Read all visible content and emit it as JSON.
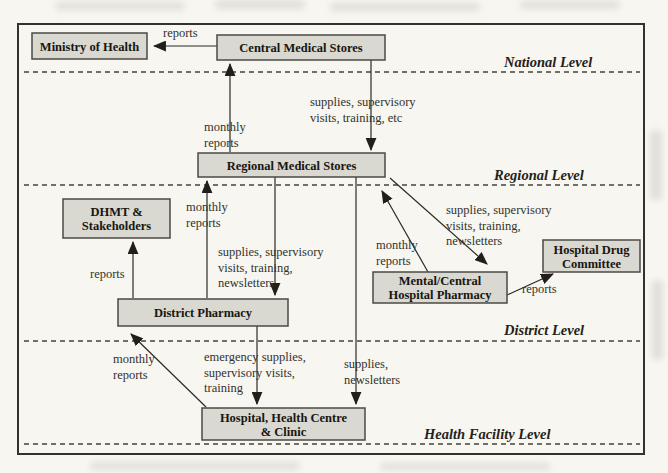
{
  "diagram": {
    "title_hint": "Drug distribution and reporting flows across health system levels",
    "colors": {
      "paper": "#f7f6f1",
      "box_fill": "#d9d8d1",
      "box_stroke": "#4c4a44",
      "line": "#2b2a24",
      "text": "#181610"
    },
    "frame": {
      "x": 18,
      "y": 24,
      "w": 626,
      "h": 430
    },
    "levels": [
      {
        "name": "national-level",
        "label": "National Level",
        "label_x": 504,
        "label_y": 67,
        "line_y": 72
      },
      {
        "name": "regional-level",
        "label": "Regional Level",
        "label_x": 494,
        "label_y": 180,
        "line_y": 185
      },
      {
        "name": "district-level",
        "label": "District Level",
        "label_x": 504,
        "label_y": 335,
        "line_y": 341
      },
      {
        "name": "health-facility-level",
        "label": "Health Facility Level",
        "label_x": 424,
        "label_y": 439,
        "line_y": 444
      }
    ],
    "nodes": [
      {
        "name": "ministry-of-health",
        "lines": [
          "Ministry of Health"
        ],
        "x": 32,
        "y": 33,
        "w": 115,
        "h": 26
      },
      {
        "name": "central-medical-stores",
        "lines": [
          "Central Medical Stores"
        ],
        "x": 217,
        "y": 35,
        "w": 168,
        "h": 25
      },
      {
        "name": "regional-medical-stores",
        "lines": [
          "Regional Medical Stores"
        ],
        "x": 198,
        "y": 153,
        "w": 187,
        "h": 24
      },
      {
        "name": "dhmt-stakeholders",
        "lines": [
          "DHMT &",
          "Stakeholders"
        ],
        "x": 63,
        "y": 199,
        "w": 107,
        "h": 39
      },
      {
        "name": "district-pharmacy",
        "lines": [
          "District Pharmacy"
        ],
        "x": 118,
        "y": 299,
        "w": 170,
        "h": 27
      },
      {
        "name": "mental-central-hospital-pharmacy",
        "lines": [
          "Mental/Central",
          "Hospital Pharmacy"
        ],
        "x": 373,
        "y": 272,
        "w": 134,
        "h": 31
      },
      {
        "name": "hospital-drug-committee",
        "lines": [
          "Hospital Drug",
          "Committee"
        ],
        "x": 543,
        "y": 240,
        "w": 97,
        "h": 32
      },
      {
        "name": "hospital-health-centre-clinic",
        "lines": [
          "Hospital, Health Centre",
          "& Clinic"
        ],
        "x": 202,
        "y": 408,
        "w": 163,
        "h": 32
      }
    ],
    "edges": [
      {
        "name": "edge-cms-to-moh",
        "x1": 217,
        "y1": 46,
        "x2": 154,
        "y2": 46
      },
      {
        "name": "edge-rms-to-cms",
        "x1": 230,
        "y1": 152,
        "x2": 230,
        "y2": 64
      },
      {
        "name": "edge-cms-to-rms",
        "x1": 371,
        "y1": 60,
        "x2": 371,
        "y2": 150
      },
      {
        "name": "edge-dp-to-rms",
        "x1": 207,
        "y1": 298,
        "x2": 207,
        "y2": 181
      },
      {
        "name": "edge-rms-to-dp",
        "x1": 275,
        "y1": 177,
        "x2": 275,
        "y2": 295
      },
      {
        "name": "edge-dp-to-dhmt",
        "x1": 133,
        "y1": 298,
        "x2": 133,
        "y2": 242
      },
      {
        "name": "edge-rms-to-hospital",
        "x1": 356,
        "y1": 177,
        "x2": 356,
        "y2": 404
      },
      {
        "name": "edge-hospital-to-dp",
        "x1": 206,
        "y1": 407,
        "x2": 131,
        "y2": 334
      },
      {
        "name": "edge-dp-to-hospital",
        "x1": 257,
        "y1": 326,
        "x2": 257,
        "y2": 404
      },
      {
        "name": "edge-rms-to-mchp",
        "x1": 390,
        "y1": 178,
        "x2": 487,
        "y2": 264
      },
      {
        "name": "edge-mchp-to-rms",
        "x1": 428,
        "y1": 272,
        "x2": 382,
        "y2": 191
      },
      {
        "name": "edge-mchp-to-hdc",
        "x1": 507,
        "y1": 295,
        "x2": 553,
        "y2": 274
      }
    ],
    "edge_labels": [
      {
        "name": "label-reports-cms-moh",
        "lines": [
          "reports"
        ],
        "x": 163,
        "y": 37
      },
      {
        "name": "label-monthly-reports-rms-cms",
        "lines": [
          "monthly",
          "reports"
        ],
        "x": 204,
        "y": 131
      },
      {
        "name": "label-supplies-cms-rms",
        "lines": [
          "supplies, supervisory",
          "visits, training, etc"
        ],
        "x": 310,
        "y": 106
      },
      {
        "name": "label-monthly-reports-dp-rms",
        "lines": [
          "monthly",
          "reports"
        ],
        "x": 186,
        "y": 211
      },
      {
        "name": "label-supplies-rms-dp",
        "lines": [
          "supplies, supervisory",
          "visits, training,",
          "newsletters"
        ],
        "x": 218,
        "y": 256
      },
      {
        "name": "label-reports-dp-dhmt",
        "lines": [
          "reports"
        ],
        "x": 90,
        "y": 278
      },
      {
        "name": "label-supplies-rms-mchp",
        "lines": [
          "supplies, supervisory",
          "visits, training,",
          "newsletters"
        ],
        "x": 446,
        "y": 214
      },
      {
        "name": "label-monthly-reports-mchp-rms",
        "lines": [
          "monthly",
          "reports"
        ],
        "x": 376,
        "y": 249
      },
      {
        "name": "label-reports-mchp-hdc",
        "lines": [
          "reports"
        ],
        "x": 522,
        "y": 293
      },
      {
        "name": "label-monthly-reports-hosp-dp",
        "lines": [
          "monthly",
          "reports"
        ],
        "x": 113,
        "y": 363
      },
      {
        "name": "label-emergency-dp-hospital",
        "lines": [
          "emergency supplies,",
          "supervisory visits,",
          "training"
        ],
        "x": 204,
        "y": 361
      },
      {
        "name": "label-supplies-rms-hospital",
        "lines": [
          "supplies,",
          "newsletters"
        ],
        "x": 344,
        "y": 368
      }
    ]
  }
}
